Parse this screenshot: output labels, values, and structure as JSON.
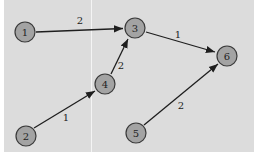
{
  "diagram": {
    "type": "directed-weighted-graph",
    "nodes": [
      {
        "id": "1",
        "label": "1",
        "x": 25,
        "y": 32
      },
      {
        "id": "2",
        "label": "2",
        "x": 26,
        "y": 136
      },
      {
        "id": "3",
        "label": "3",
        "x": 135,
        "y": 28
      },
      {
        "id": "4",
        "label": "4",
        "x": 105,
        "y": 84
      },
      {
        "id": "5",
        "label": "5",
        "x": 136,
        "y": 133
      },
      {
        "id": "6",
        "label": "6",
        "x": 227,
        "y": 56
      }
    ],
    "edges": [
      {
        "from": "1",
        "to": "3",
        "weight": "2"
      },
      {
        "from": "3",
        "to": "6",
        "weight": "1"
      },
      {
        "from": "2",
        "to": "4",
        "weight": "1"
      },
      {
        "from": "4",
        "to": "3",
        "weight": "2"
      },
      {
        "from": "5",
        "to": "6",
        "weight": "2"
      }
    ],
    "colors": {
      "background": "#dcdcdc",
      "node_fill": "#a3a3a3",
      "node_stroke": "#3a3a3a",
      "edge": "#1e1e1e"
    }
  }
}
